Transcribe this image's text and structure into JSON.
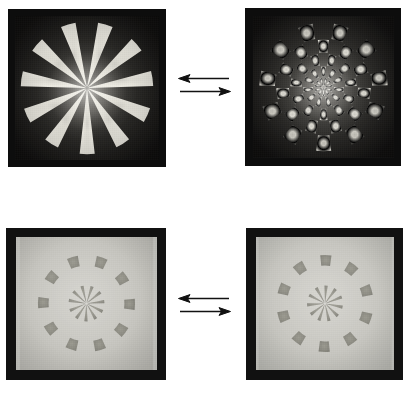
{
  "figure": {
    "background_color": "#ffffff",
    "layout": "2x2 grid of photographic plates joined by reversible (equilibrium) arrow pairs",
    "width": 407,
    "height": 393
  },
  "panels": [
    {
      "id": "top-left",
      "name": "radial-sector-pinwheel-dark",
      "caption": "",
      "frame_color": "#0d0d0d",
      "field_color": "#1a1a1a",
      "pattern_color": "#e8e6de",
      "pattern": {
        "type": "radial-sectors",
        "sectors": 22,
        "lit_sectors": 11,
        "rings": 1,
        "duty_cycle": 0.5,
        "outer_radius_pct": 46,
        "inner_radius_pct": 0,
        "rotation_deg": 8
      },
      "bounds": {
        "x": 8,
        "y": 9,
        "w": 158,
        "h": 158
      }
    },
    {
      "id": "top-right",
      "name": "radial-checkerboard-dark",
      "caption": "",
      "frame_color": "#0d0d0d",
      "field_color": "#1a1a1a",
      "pattern_color": "#e8e6de",
      "pattern": {
        "type": "radial-checkerboard",
        "sectors": 22,
        "rings": 5,
        "ring_radii_pct": [
          5,
          14,
          24,
          34,
          43
        ],
        "outer_radius_pct": 46,
        "rotation_deg": 8
      },
      "bounds": {
        "x": 245,
        "y": 8,
        "w": 156,
        "h": 158
      }
    },
    {
      "id": "bottom-left",
      "name": "radial-checkerboard-light-a",
      "caption": "",
      "frame_color": "#111111",
      "field_color": "#c9c9c4",
      "pattern_color": "#8e8e88",
      "pattern": {
        "type": "radial-checkerboard",
        "sectors": 20,
        "rings": 2,
        "outer_ring_segments": 10,
        "inner_ring_segments": 11,
        "ring_radii_pct": [
          7,
          18,
          30,
          38
        ],
        "outer_radius_pct": 38,
        "rotation_deg": 10
      },
      "bounds": {
        "x": 6,
        "y": 228,
        "w": 160,
        "h": 152
      }
    },
    {
      "id": "bottom-right",
      "name": "radial-checkerboard-light-b",
      "caption": "",
      "frame_color": "#111111",
      "field_color": "#c9c9c4",
      "pattern_color": "#8e8e88",
      "pattern": {
        "type": "radial-checkerboard",
        "sectors": 20,
        "rings": 2,
        "outer_ring_segments": 10,
        "inner_ring_segments": 11,
        "ring_radii_pct": [
          7,
          18,
          30,
          38
        ],
        "outer_radius_pct": 38,
        "rotation_deg": 28
      },
      "bounds": {
        "x": 246,
        "y": 228,
        "w": 157,
        "h": 152
      }
    }
  ],
  "connectors": [
    {
      "id": "top-arrows",
      "name": "equilibrium-arrows-top",
      "type": "equilibrium-arrow-pair",
      "directions": [
        "left",
        "right"
      ],
      "color": "#111111",
      "bounds": {
        "x": 177,
        "y": 72,
        "w": 55,
        "h": 26
      }
    },
    {
      "id": "bottom-arrows",
      "name": "equilibrium-arrows-bottom",
      "type": "equilibrium-arrow-pair",
      "directions": [
        "left",
        "right"
      ],
      "color": "#111111",
      "bounds": {
        "x": 177,
        "y": 292,
        "w": 55,
        "h": 26
      }
    }
  ],
  "chart_data": {
    "type": "table",
    "title": "",
    "note": "Four photographic plates of radial sector / radial checkerboard targets arranged 2x2, each row joined by a reversible double-arrow.",
    "categories": [
      "top-left",
      "top-right",
      "bottom-left",
      "bottom-right"
    ],
    "series": [
      {
        "name": "angular sectors",
        "values": [
          22,
          22,
          20,
          20
        ]
      },
      {
        "name": "radial rings",
        "values": [
          1,
          5,
          2,
          2
        ]
      }
    ],
    "legend": [],
    "grid": false
  }
}
